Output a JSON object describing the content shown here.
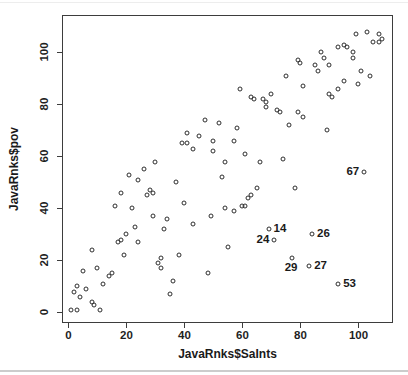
{
  "chart_data": {
    "type": "scatter",
    "title": "",
    "xlabel": "JavaRnks$SaInts",
    "ylabel": "JavaRnks$pov",
    "xlim": [
      -2.2,
      111.9
    ],
    "ylim": [
      -4.1,
      114.4
    ],
    "x_ticks": [
      0,
      20,
      40,
      60,
      80,
      100
    ],
    "y_ticks": [
      0,
      20,
      40,
      60,
      80,
      100
    ],
    "grid": false,
    "legend": null,
    "marker": "open-circle",
    "colors": {
      "marker_stroke": "#2e2e2e",
      "axis": "#3d3d3d",
      "text": "#1a1a1a",
      "background": "#ffffff"
    },
    "points": [
      [
        1,
        1
      ],
      [
        3,
        1
      ],
      [
        11,
        1
      ],
      [
        9,
        3
      ],
      [
        8,
        4
      ],
      [
        4,
        6
      ],
      [
        2,
        8
      ],
      [
        6,
        9
      ],
      [
        3,
        10
      ],
      [
        12,
        11
      ],
      [
        35,
        7
      ],
      [
        36,
        12
      ],
      [
        14,
        14
      ],
      [
        15,
        15
      ],
      [
        5,
        16
      ],
      [
        48,
        15
      ],
      [
        10,
        17
      ],
      [
        32,
        17
      ],
      [
        31,
        19
      ],
      [
        32,
        21
      ],
      [
        19,
        22
      ],
      [
        38,
        22
      ],
      [
        8,
        24
      ],
      [
        55,
        25
      ],
      [
        17,
        27
      ],
      [
        24,
        27
      ],
      [
        18,
        28
      ],
      [
        20,
        30
      ],
      [
        33,
        32
      ],
      [
        23,
        33
      ],
      [
        43,
        34
      ],
      [
        34,
        36
      ],
      [
        29,
        37
      ],
      [
        49,
        37
      ],
      [
        57,
        39
      ],
      [
        54,
        40
      ],
      [
        16,
        41
      ],
      [
        22,
        40
      ],
      [
        60,
        41
      ],
      [
        61,
        41
      ],
      [
        40,
        42
      ],
      [
        62,
        44
      ],
      [
        27,
        45
      ],
      [
        63,
        45
      ],
      [
        29,
        46
      ],
      [
        18,
        46
      ],
      [
        28,
        47
      ],
      [
        65,
        48
      ],
      [
        78,
        48
      ],
      [
        37,
        50
      ],
      [
        24,
        51
      ],
      [
        53,
        52
      ],
      [
        21,
        53
      ],
      [
        26,
        55
      ],
      [
        30,
        58
      ],
      [
        54,
        58
      ],
      [
        66,
        58
      ],
      [
        74,
        59
      ],
      [
        61,
        61
      ],
      [
        50,
        62
      ],
      [
        43,
        63
      ],
      [
        41,
        65
      ],
      [
        39,
        65
      ],
      [
        57,
        66
      ],
      [
        50,
        66
      ],
      [
        45,
        68
      ],
      [
        41,
        69
      ],
      [
        89,
        70
      ],
      [
        58,
        71
      ],
      [
        76,
        72
      ],
      [
        52,
        73
      ],
      [
        47,
        74
      ],
      [
        81,
        75
      ],
      [
        73,
        77
      ],
      [
        79,
        77
      ],
      [
        72,
        78
      ],
      [
        68,
        79
      ],
      [
        68,
        81
      ],
      [
        64,
        82
      ],
      [
        67,
        82
      ],
      [
        63,
        83
      ],
      [
        70,
        84
      ],
      [
        91,
        83
      ],
      [
        90,
        84
      ],
      [
        59,
        86
      ],
      [
        93,
        86
      ],
      [
        81,
        87
      ],
      [
        100,
        88
      ],
      [
        95,
        89
      ],
      [
        75,
        91
      ],
      [
        86,
        93
      ],
      [
        101,
        93
      ],
      [
        104,
        91
      ],
      [
        85,
        95
      ],
      [
        90,
        95
      ],
      [
        80,
        96
      ],
      [
        79,
        97
      ],
      [
        88,
        98
      ],
      [
        98,
        98
      ],
      [
        98,
        100
      ],
      [
        87,
        100
      ],
      [
        93,
        102
      ],
      [
        96,
        102
      ],
      [
        95,
        103
      ],
      [
        105,
        104
      ],
      [
        107,
        104
      ],
      [
        108,
        105
      ],
      [
        99,
        107
      ],
      [
        107,
        107
      ],
      [
        103,
        108
      ]
    ],
    "labeled_points": [
      {
        "x": 69,
        "y": 32,
        "label": "14",
        "pos": "right"
      },
      {
        "x": 71,
        "y": 28,
        "label": "24",
        "pos": "left"
      },
      {
        "x": 84,
        "y": 30,
        "label": "26",
        "pos": "right"
      },
      {
        "x": 77,
        "y": 21,
        "label": "29",
        "pos": "below"
      },
      {
        "x": 83,
        "y": 18,
        "label": "27",
        "pos": "right"
      },
      {
        "x": 93,
        "y": 11,
        "label": "53",
        "pos": "right"
      },
      {
        "x": 102,
        "y": 54,
        "label": "67",
        "pos": "left"
      }
    ]
  }
}
